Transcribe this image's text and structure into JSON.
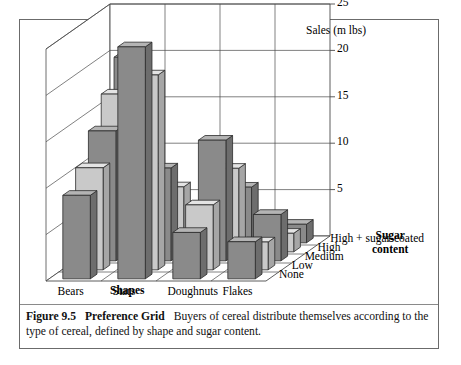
{
  "figure": {
    "number": "Figure 9.5",
    "title": "Preference Grid",
    "caption": "Buyers of cereal distribute themselves according to the type of cereal, defined by shape and sugar content."
  },
  "chart_data": {
    "type": "bar",
    "projection": "3d",
    "title": "",
    "ylabel": "Sales (m lbs)",
    "xlabel": "Shapes",
    "zlabel": "Sugar content",
    "ylim": [
      0,
      25
    ],
    "yticks": [
      25,
      20,
      15,
      10,
      5
    ],
    "grid": true,
    "legend": "none",
    "categories": [
      "Bears",
      "Stars",
      "Doughnuts",
      "Flakes"
    ],
    "series": [
      {
        "name": "High + sugar-coated",
        "values": [
          9,
          25,
          5,
          4
        ],
        "color": "#8a8a8a"
      },
      {
        "name": "High",
        "values": [
          11,
          21,
          7,
          3
        ],
        "color": "#c9c9c9"
      },
      {
        "name": "Medium",
        "values": [
          14,
          10,
          13,
          5
        ],
        "color": "#8a8a8a"
      },
      {
        "name": "Low",
        "values": [
          17,
          7,
          9,
          2
        ],
        "color": "#c9c9c9"
      },
      {
        "name": "None",
        "values": [
          20,
          4,
          6,
          2
        ],
        "color": "#8a8a8a"
      }
    ]
  },
  "axes": {
    "y_title": "Sales (m lbs)",
    "y_ticks": [
      "25",
      "20",
      "15",
      "10",
      "5"
    ],
    "x_title": "Shapes",
    "x_labels": [
      "Bears",
      "Stars",
      "Doughnuts",
      "Flakes"
    ],
    "z_title_line1": "Sugar",
    "z_title_line2": "content",
    "z_labels": [
      "High + sugar-coated",
      "High",
      "Medium",
      "Low",
      "None"
    ]
  },
  "colors": {
    "bar_dark": "#8a8a8a",
    "bar_light": "#c9c9c9",
    "bar_top_dark": "#b4b4b4",
    "bar_top_light": "#e4e4e4",
    "bar_side_dark": "#6d6d6d",
    "bar_side_light": "#a6a6a6",
    "outline": "#2b2b2b",
    "grid": "#4a4a4a",
    "frame": "#6b6b6b"
  }
}
